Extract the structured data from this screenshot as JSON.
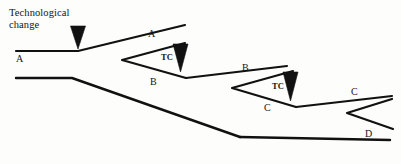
{
  "figure": {
    "type": "branching-lineage-diagram",
    "caption": "Technological\nchange",
    "stroke_color": "#111111",
    "background_color": "#fdfdfc",
    "width": 401,
    "height": 164
  },
  "labels": {
    "caption": "Technological\nchange",
    "lineage_a_root": "A",
    "lineage_a_upper": "A",
    "lineage_b_mid": "B",
    "lineage_b_upper": "B",
    "lineage_c_lower": "C",
    "lineage_c_upper": "C",
    "lineage_d": "D",
    "tc_second": "TC",
    "tc_third": "TC"
  },
  "markers": [
    {
      "name": "technological-change-marker-1",
      "x": 78,
      "y": 30,
      "label": "Technological change"
    },
    {
      "name": "technological-change-marker-2",
      "x": 180,
      "y": 48,
      "label": "TC"
    },
    {
      "name": "technological-change-marker-3",
      "x": 290,
      "y": 76,
      "label": "TC"
    }
  ],
  "label_positions": [
    {
      "key": "caption",
      "name": "caption-label",
      "x": 9,
      "y": 7,
      "text": "Technological\nchange"
    },
    {
      "key": "lineage_a_root",
      "name": "label-a-root",
      "x": 16,
      "y": 58,
      "text": "A"
    },
    {
      "key": "lineage_a_upper",
      "name": "label-a-upper",
      "x": 148,
      "y": 32,
      "text": "A"
    },
    {
      "key": "tc_second",
      "name": "label-tc-second",
      "x": 164,
      "y": 55,
      "text": "TC"
    },
    {
      "key": "lineage_b_mid",
      "name": "label-b-mid",
      "x": 150,
      "y": 79,
      "text": "B"
    },
    {
      "key": "lineage_b_upper",
      "name": "label-b-upper",
      "x": 243,
      "y": 65,
      "text": "B"
    },
    {
      "key": "tc_third",
      "name": "label-tc-third",
      "x": 276,
      "y": 83,
      "text": "TC"
    },
    {
      "key": "lineage_c_lower",
      "name": "label-c-lower",
      "x": 264,
      "y": 105,
      "text": "C"
    },
    {
      "key": "lineage_c_upper",
      "name": "label-c-upper",
      "x": 351,
      "y": 89,
      "text": "C"
    },
    {
      "key": "lineage_d",
      "name": "label-d",
      "x": 365,
      "y": 131,
      "text": "D"
    }
  ]
}
